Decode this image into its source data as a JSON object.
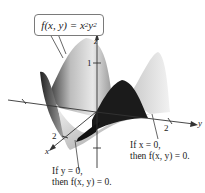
{
  "figure": {
    "formula": {
      "prefix": "f(x, y) = x",
      "exp1": "2",
      "mid": "y",
      "exp2": "2"
    },
    "axes": {
      "x_label": "x",
      "y_label": "y",
      "z_label": "z",
      "x_tick": "2",
      "y_tick": "2",
      "z_tick": "1"
    },
    "annotations": [
      {
        "line1": "If y = 0,",
        "line2": "then f(x, y) = 0."
      },
      {
        "line1": "If x = 0,",
        "line2": "then f(x, y) = 0."
      }
    ],
    "colors": {
      "surface_light": "#d9d9d9",
      "surface_mid": "#a8a8a8",
      "surface_dark": "#1a1a1a",
      "axis": "#333333",
      "callout_border": "#7a7a7a"
    }
  }
}
